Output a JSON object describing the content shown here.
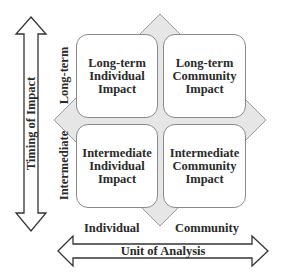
{
  "diagram": {
    "quadrants": [
      {
        "id": "top-left",
        "label": "Long-term\nIndividual\nImpact"
      },
      {
        "id": "top-right",
        "label": "Long-term\nCommunity\nImpact"
      },
      {
        "id": "bottom-left",
        "label": "Intermediate\nIndividual\nImpact"
      },
      {
        "id": "bottom-right",
        "label": "Intermediate\nCommunity\nImpact"
      }
    ],
    "y_axis": {
      "title": "Timing of Impact",
      "levels": [
        "Long-term",
        "Intermediate"
      ]
    },
    "x_axis": {
      "title": "Unit of Analysis",
      "levels": [
        "Individual",
        "Community"
      ]
    },
    "colors": {
      "diamond_fill": "#e6e6e6",
      "stroke": "#8a8a8a",
      "text": "#2a2a2a"
    }
  }
}
